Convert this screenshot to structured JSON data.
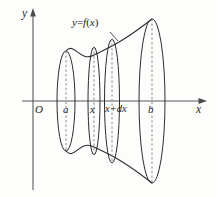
{
  "figure": {
    "kind": "solid-of-revolution-diagram",
    "background_color": "#fdfdfc",
    "ink_color": "#2c2c2e",
    "axis_color": "#58585a",
    "dash_color": "#8a8a8c"
  },
  "axes": {
    "y_label": "y",
    "x_label": "x",
    "origin_label": "O",
    "x_axis_y_px": 101,
    "y_axis_x_px": 33
  },
  "marks": [
    {
      "id": "a",
      "label": "a",
      "x_px": 66
    },
    {
      "id": "x",
      "label": "x",
      "x_px": 94
    },
    {
      "id": "xdx",
      "label": "x+",
      "label_roman": "d",
      "label_tail": "x",
      "x_px": 112
    },
    {
      "id": "b",
      "label": "b",
      "x_px": 152
    }
  ],
  "curve_label": {
    "prefix": "y",
    "equals": "=",
    "func": "f",
    "open": "(",
    "arg": "x",
    "close": ")"
  },
  "cross_sections": [
    {
      "id": "ellipse-a",
      "cx": 66,
      "cy": 101,
      "rx": 9.0,
      "ry": 50
    },
    {
      "id": "ellipse-x",
      "cx": 94,
      "cy": 101,
      "rx": 6.0,
      "ry": 54
    },
    {
      "id": "ellipse-xdx",
      "cx": 112,
      "cy": 101,
      "rx": 7.5,
      "ry": 62
    },
    {
      "id": "ellipse-b",
      "cx": 152,
      "cy": 101,
      "rx": 13.0,
      "ry": 82
    }
  ],
  "boundary": {
    "top_path": "M 66 51 C 74 41 80 63 94 55 C 108 48 120 44 152 19",
    "bottom_path": "M 66 151 C 74 161 80 139 94 147 C 108 154 120 158 152 183"
  }
}
